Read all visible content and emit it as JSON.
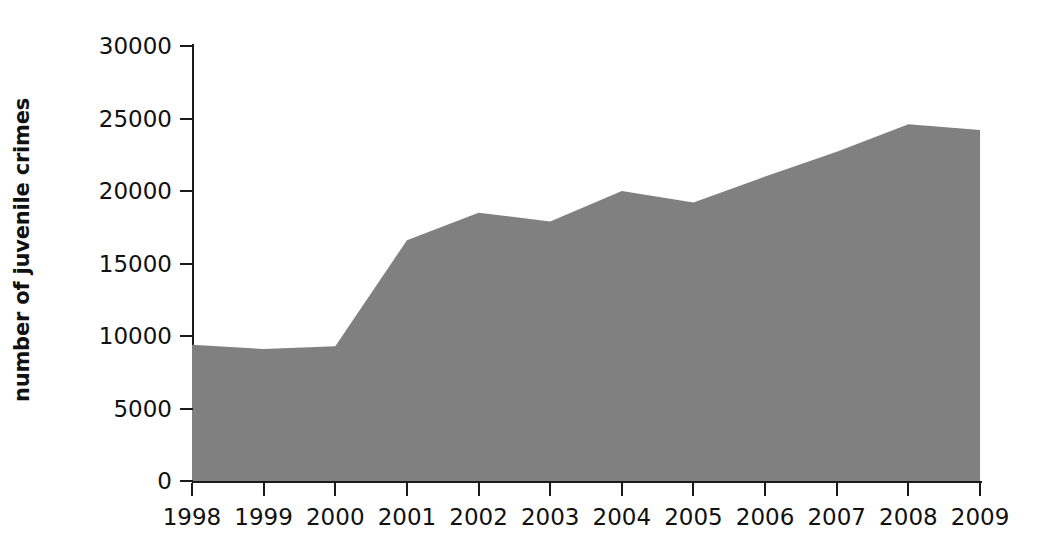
{
  "chart_data": {
    "type": "area",
    "title": "",
    "subtitle": "",
    "xlabel": "",
    "ylabel": "number of juvenile crimes",
    "categories": [
      "1998",
      "1999",
      "2000",
      "2001",
      "2002",
      "2003",
      "2004",
      "2005",
      "2006",
      "2007",
      "2008",
      "2009"
    ],
    "x": [
      1998,
      1999,
      2000,
      2001,
      2002,
      2003,
      2004,
      2005,
      2006,
      2007,
      2008,
      2009
    ],
    "values": [
      9400,
      9100,
      9300,
      16600,
      18500,
      17900,
      20000,
      19200,
      21000,
      22700,
      24600,
      24200
    ],
    "series": [
      {
        "name": "number of juvenile crimes",
        "values": [
          9400,
          9100,
          9300,
          16600,
          18500,
          17900,
          20000,
          19200,
          21000,
          22700,
          24600,
          24200
        ]
      }
    ],
    "ylim": [
      0,
      30000
    ],
    "ytick_labels": [
      "0",
      "5000",
      "10000",
      "15000",
      "20000",
      "25000",
      "30000"
    ],
    "ytick_values": [
      0,
      5000,
      10000,
      15000,
      20000,
      25000,
      30000
    ],
    "grid": false,
    "legend": false,
    "legend_position": "none",
    "annotations": [],
    "colors": {
      "area_fill": "#808080",
      "axis": "#1a1a1a",
      "text": "#111111",
      "background": "#ffffff"
    }
  }
}
